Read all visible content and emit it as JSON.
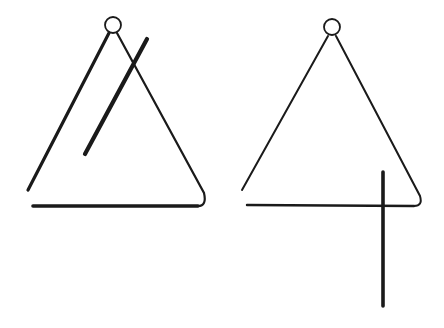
{
  "illustration": {
    "subject": "two triangle percussion instruments with beaters",
    "colors": {
      "background": "#ffffff",
      "ink": "#1a1a1a"
    },
    "figures": [
      {
        "name": "left-triangle",
        "ring": {
          "cx": 113,
          "cy": 25,
          "r": 8
        },
        "left_leg": {
          "x1": 109,
          "y1": 33,
          "x2": 28,
          "y2": 190,
          "width": 3.2
        },
        "right_leg": {
          "x1": 117,
          "y1": 33,
          "x2": 204,
          "y2": 193,
          "width": 2.2
        },
        "bottom_bar": {
          "x1": 33,
          "y1": 206,
          "x2": 198,
          "y2": 206,
          "width": 3.6
        },
        "beater": {
          "x1": 147,
          "y1": 39,
          "x2": 85,
          "y2": 154,
          "width": 4.2
        }
      },
      {
        "name": "right-triangle",
        "ring": {
          "cx": 332,
          "cy": 27,
          "r": 8
        },
        "left_leg": {
          "x1": 328,
          "y1": 36,
          "x2": 242,
          "y2": 190,
          "width": 2
        },
        "right_leg": {
          "x1": 336,
          "y1": 36,
          "x2": 420,
          "y2": 196,
          "width": 2
        },
        "bottom_bar": {
          "x1": 247,
          "y1": 205,
          "x2": 414,
          "y2": 206,
          "width": 2.4
        },
        "beater": {
          "x1": 383,
          "y1": 172,
          "x2": 383,
          "y2": 306,
          "width": 3.6
        }
      }
    ]
  }
}
